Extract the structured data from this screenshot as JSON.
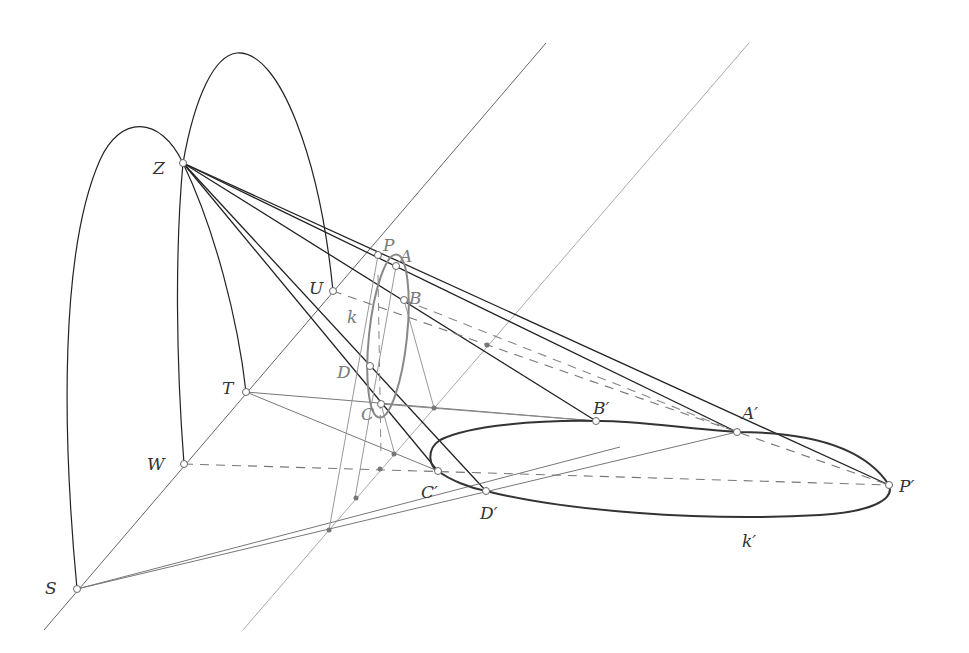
{
  "colors": {
    "dark_line": "#222222",
    "mid_line": "#666666",
    "light_line": "#9a9a9a",
    "dashed_line": "#777777",
    "background": "#ffffff"
  },
  "points": [
    {
      "id": "Z",
      "label": "Z",
      "style": "dark"
    },
    {
      "id": "U",
      "label": "U",
      "style": "dark"
    },
    {
      "id": "T",
      "label": "T",
      "style": "dark"
    },
    {
      "id": "W",
      "label": "W",
      "style": "dark"
    },
    {
      "id": "S",
      "label": "S",
      "style": "dark"
    },
    {
      "id": "P",
      "label": "P",
      "style": "gray"
    },
    {
      "id": "A",
      "label": "A",
      "style": "gray"
    },
    {
      "id": "B",
      "label": "B",
      "style": "gray"
    },
    {
      "id": "C",
      "label": "C",
      "style": "gray"
    },
    {
      "id": "D",
      "label": "D",
      "style": "gray"
    },
    {
      "id": "A1",
      "label": "A′",
      "style": "dark"
    },
    {
      "id": "B1",
      "label": "B′",
      "style": "dark"
    },
    {
      "id": "C1",
      "label": "C′",
      "style": "dark"
    },
    {
      "id": "D1",
      "label": "D′",
      "style": "dark"
    },
    {
      "id": "P1",
      "label": "P′",
      "style": "dark"
    }
  ],
  "curves": [
    {
      "id": "k",
      "label": "k",
      "style": "gray"
    },
    {
      "id": "k1",
      "label": "k′",
      "style": "dark"
    }
  ]
}
